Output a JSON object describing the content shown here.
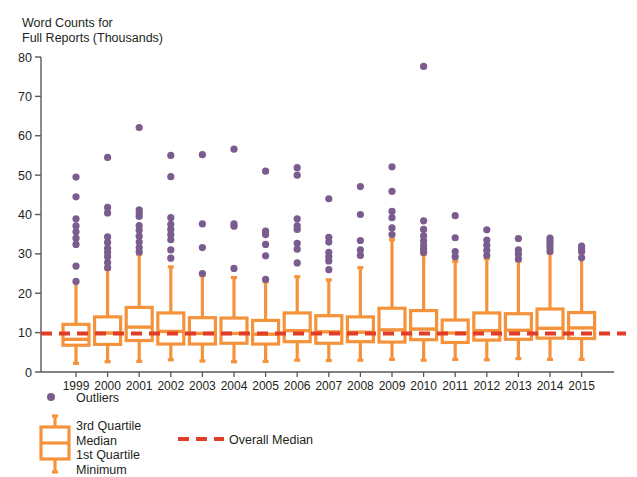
{
  "chart_data": {
    "type": "box",
    "title": "Word Counts for\nFull Reports (Thousands)",
    "xlabel": "",
    "ylabel": "Word Counts for Full Reports (Thousands)",
    "ylim": [
      0,
      80
    ],
    "yticks": [
      0,
      10,
      20,
      30,
      40,
      50,
      60,
      70,
      80
    ],
    "grid": false,
    "legend_position": "bottom-left",
    "overall_median": 9.8,
    "categories": [
      "1999",
      "2000",
      "2001",
      "2002",
      "2003",
      "2004",
      "2005",
      "2006",
      "2007",
      "2008",
      "2009",
      "2010",
      "2011",
      "2012",
      "2013",
      "2014",
      "2015"
    ],
    "boxes": [
      {
        "category": "1999",
        "min": 2.2,
        "q1": 6.8,
        "median": 8.3,
        "q3": 12.1,
        "max": 22.9,
        "outliers": [
          23.0,
          26.9,
          32.4,
          34.0,
          35.6,
          37.1,
          38.9,
          44.5,
          49.5
        ]
      },
      {
        "category": "2000",
        "min": 2.6,
        "q1": 7.0,
        "median": 9.9,
        "q3": 14.0,
        "max": 26.1,
        "outliers": [
          26.5,
          27.8,
          29.3,
          30.4,
          31.4,
          32.9,
          34.3,
          40.4,
          41.8,
          54.5
        ]
      },
      {
        "category": "2001",
        "min": 2.7,
        "q1": 8.0,
        "median": 11.4,
        "q3": 16.4,
        "max": 29.9,
        "outliers": [
          30.5,
          31.6,
          33.0,
          34.5,
          36.0,
          37.2,
          39.5,
          40.4,
          41.2,
          62.1
        ]
      },
      {
        "category": "2002",
        "min": 3.1,
        "q1": 7.1,
        "median": 10.3,
        "q3": 15.0,
        "max": 26.7,
        "outliers": [
          28.9,
          31.0,
          33.6,
          34.9,
          36.2,
          37.5,
          39.2,
          49.6,
          55.0
        ]
      },
      {
        "category": "2003",
        "min": 2.8,
        "q1": 7.1,
        "median": 9.8,
        "q3": 13.8,
        "max": 24.5,
        "outliers": [
          25.0,
          31.6,
          37.6,
          55.2
        ]
      },
      {
        "category": "2004",
        "min": 2.6,
        "q1": 7.3,
        "median": 9.8,
        "q3": 13.7,
        "max": 24.0,
        "outliers": [
          26.3,
          37.0,
          37.6,
          56.6
        ]
      },
      {
        "category": "2005",
        "min": 2.7,
        "q1": 7.1,
        "median": 9.6,
        "q3": 13.1,
        "max": 22.9,
        "outliers": [
          23.5,
          29.5,
          32.4,
          34.9,
          35.8,
          51.0
        ]
      },
      {
        "category": "2006",
        "min": 3.0,
        "q1": 7.7,
        "median": 10.5,
        "q3": 15.0,
        "max": 24.2,
        "outliers": [
          27.7,
          31.2,
          32.7,
          36.2,
          37.1,
          38.9,
          50.0,
          51.9
        ]
      },
      {
        "category": "2007",
        "min": 2.9,
        "q1": 7.3,
        "median": 10.2,
        "q3": 14.3,
        "max": 23.4,
        "outliers": [
          26.0,
          28.2,
          29.3,
          30.4,
          33.0,
          34.2,
          44.0
        ]
      },
      {
        "category": "2008",
        "min": 3.0,
        "q1": 7.7,
        "median": 10.1,
        "q3": 14.0,
        "max": 26.5,
        "outliers": [
          29.6,
          31.0,
          33.4,
          40.0,
          47.1
        ]
      },
      {
        "category": "2009",
        "min": 3.2,
        "q1": 7.6,
        "median": 10.7,
        "q3": 16.2,
        "max": 33.6,
        "outliers": [
          34.9,
          36.6,
          39.2,
          40.8,
          45.9,
          52.1
        ]
      },
      {
        "category": "2010",
        "min": 3.0,
        "q1": 8.2,
        "median": 10.9,
        "q3": 15.6,
        "max": 29.8,
        "outliers": [
          30.4,
          31.2,
          32.1,
          33.3,
          34.6,
          36.2,
          38.4,
          77.6
        ]
      },
      {
        "category": "2011",
        "min": 3.2,
        "q1": 7.5,
        "median": 9.9,
        "q3": 13.2,
        "max": 28.1,
        "outliers": [
          29.3,
          30.6,
          34.1,
          39.7
        ]
      },
      {
        "category": "2012",
        "min": 3.1,
        "q1": 8.1,
        "median": 10.5,
        "q3": 15.0,
        "max": 28.8,
        "outliers": [
          29.6,
          30.9,
          32.2,
          33.5,
          36.1
        ]
      },
      {
        "category": "2013",
        "min": 3.4,
        "q1": 8.3,
        "median": 10.6,
        "q3": 14.8,
        "max": 28.2,
        "outliers": [
          28.7,
          29.9,
          31.0,
          33.9
        ]
      },
      {
        "category": "2014",
        "min": 3.2,
        "q1": 8.6,
        "median": 11.1,
        "q3": 16.0,
        "max": 30.2,
        "outliers": [
          30.6,
          31.5,
          32.4,
          33.2,
          34.0
        ]
      },
      {
        "category": "2015",
        "min": 3.2,
        "q1": 8.5,
        "median": 11.2,
        "q3": 15.1,
        "max": 30.2,
        "outliers": [
          29.0,
          30.6,
          31.3,
          32.0
        ]
      }
    ]
  },
  "axis": {
    "y_tick_labels": [
      "80",
      "70",
      "60",
      "50",
      "40",
      "30",
      "20",
      "10",
      "0"
    ],
    "x_tick_labels": [
      "1999",
      "2000",
      "2001",
      "2002",
      "2003",
      "2004",
      "2005",
      "2006",
      "2007",
      "2008",
      "2009",
      "2010",
      "2011",
      "2012",
      "2013",
      "2014",
      "2015"
    ]
  },
  "legend": {
    "outliers_label": "Outliers",
    "box_labels": "3rd Quartile\nMedian\n1st Quartile\nMinimum",
    "overall_median_label": "Overall Median"
  },
  "colors": {
    "box_orange": "#F5933C",
    "median_red": "#E03C28",
    "outlier_purple": "#7A5C8E",
    "axis_gray": "#58595B",
    "text": "#231f20"
  }
}
